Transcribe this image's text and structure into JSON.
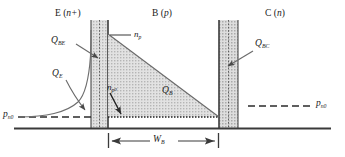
{
  "figure": {
    "type": "semiconductor-band-carrier-diagram",
    "colors": {
      "line": "#3a3a3a",
      "shade_fill": "#d4d4d4",
      "depletion_fill": "#cfcfcf",
      "text": "#1a1a1a",
      "background": "#ffffff"
    },
    "regions": {
      "emitter_label": "E (n+)",
      "emitter_symbol": "E",
      "emitter_doping": "n+",
      "base_label": "B (p)",
      "base_symbol": "B",
      "base_doping": "p",
      "collector_label": "C (n)",
      "collector_symbol": "C",
      "collector_doping": "n"
    },
    "charges": {
      "q_be": "Q_BE",
      "q_be_main": "Q",
      "q_be_sub": "BE",
      "q_e": "Q_E",
      "q_e_main": "Q",
      "q_e_sub": "E",
      "q_b": "Q_B",
      "q_b_main": "Q",
      "q_b_sub": "B",
      "q_bc": "Q_BC",
      "q_bc_main": "Q",
      "q_bc_sub": "BC"
    },
    "carriers": {
      "n_p": "n_p",
      "n_p_main": "n",
      "n_p_sub": "p",
      "n_p0": "n_p0",
      "n_p0_main": "n",
      "n_p0_sub": "p",
      "n_p0_sub2": "0",
      "p_n0_left": "p_n0",
      "p_n0_right": "p_n0",
      "p_n0_main": "p",
      "p_n0_sub": "n",
      "p_n0_sub2": "0"
    },
    "dimensions": {
      "base_width": "W_B",
      "base_width_main": "W",
      "base_width_sub": "B"
    }
  }
}
